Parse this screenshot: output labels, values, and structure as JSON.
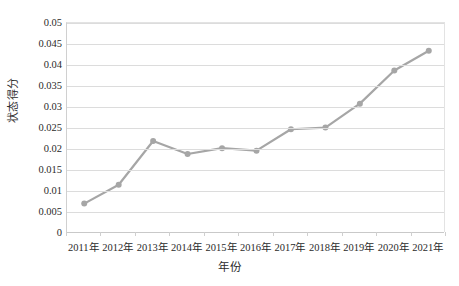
{
  "chart_data": {
    "type": "line",
    "title": "",
    "xlabel": "年份",
    "ylabel": "状态得分",
    "categories": [
      "2011年",
      "2012年",
      "2013年",
      "2014年",
      "2015年",
      "2016年",
      "2017年",
      "2018年",
      "2019年",
      "2020年",
      "2021年"
    ],
    "values": [
      0.007,
      0.0115,
      0.0219,
      0.0188,
      0.0202,
      0.0196,
      0.0247,
      0.0251,
      0.0308,
      0.0387,
      0.0434
    ],
    "series": [
      {
        "name": "状态得分",
        "values": [
          0.007,
          0.0115,
          0.0219,
          0.0188,
          0.0202,
          0.0196,
          0.0247,
          0.0251,
          0.0308,
          0.0387,
          0.0434
        ]
      }
    ],
    "ylim": [
      0,
      0.05
    ],
    "ytick_step": 0.005,
    "yticks": [
      0,
      0.005,
      0.01,
      0.015,
      0.02,
      0.025,
      0.03,
      0.035,
      0.04,
      0.045,
      0.05
    ],
    "ytick_labels": [
      "0",
      "0.005",
      "0.01",
      "0.015",
      "0.02",
      "0.025",
      "0.03",
      "0.035",
      "0.04",
      "0.045",
      "0.05"
    ],
    "grid": "horizontal",
    "legend": "none",
    "marker": "circle",
    "line_color": "#a6a6a6",
    "marker_color": "#a6a6a6",
    "gridline_color": "#dcdcdc",
    "text_color": "#2b2b2b"
  },
  "caption": {
    "text": ""
  }
}
